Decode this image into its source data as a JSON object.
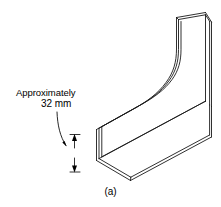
{
  "figure": {
    "caption": "(a)",
    "background_color": "#ffffff",
    "line_color": "#1a1a1a",
    "text_color": "#000000"
  },
  "callout": {
    "line1": "Approximately",
    "line2": "32 mm",
    "full_text": "Approximately 32 mm",
    "value": 32,
    "unit": "mm",
    "qualifier": "Approximately",
    "leader_icon": "leader-arrow-icon",
    "dimension_arrows": {
      "up_arrow_icon": "arrow-up-icon",
      "down_arrow_icon": "arrow-down-icon"
    }
  },
  "object": {
    "name": "bent-sheet-metal-channel",
    "description": "Isometric line drawing of an L-shaped thin-walled channel with a curved bend"
  }
}
